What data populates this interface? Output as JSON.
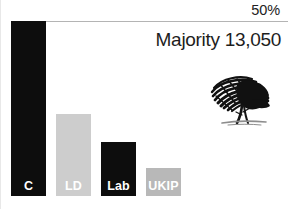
{
  "chart_data": {
    "type": "bar",
    "title": "",
    "xlabel": "",
    "ylabel": "",
    "categories": [
      "C",
      "LD",
      "Lab",
      "UKIP"
    ],
    "values": [
      50,
      23.5,
      15.5,
      8
    ],
    "ylim": [
      0,
      50
    ],
    "grid": false,
    "legend": "none",
    "series": [
      {
        "name": "Share of vote",
        "values": [
          50,
          23.5,
          15.5,
          8
        ]
      }
    ],
    "bars": [
      {
        "label": "C",
        "value": 50,
        "color": "#0d0d0d",
        "label_color": "#ffffff"
      },
      {
        "label": "LD",
        "value": 23.5,
        "color": "#cdcdcd",
        "label_color": "#ffffff"
      },
      {
        "label": "Lab",
        "value": 15.5,
        "color": "#0d0d0d",
        "label_color": "#ffffff"
      },
      {
        "label": "UKIP",
        "value": 8,
        "color": "#b8b8b8",
        "label_color": "#ffffff"
      }
    ],
    "annotations": [
      {
        "name": "threshold",
        "text": "50%",
        "value": 50
      },
      {
        "name": "majority",
        "text": "Majority 13,050"
      }
    ]
  },
  "annotations": {
    "percent_label": "50%",
    "majority_label": "Majority 13,050"
  },
  "bars": [
    {
      "label": "C"
    },
    {
      "label": "LD"
    },
    {
      "label": "Lab"
    },
    {
      "label": "UKIP"
    }
  ],
  "colors": {
    "bar_dark": "#0d0d0d",
    "bar_light_gray": "#cdcdcd",
    "bar_mid_gray": "#b8b8b8",
    "threshold_line": "#b4b4b4",
    "text": "#1d1d1d",
    "background": "#ffffff"
  },
  "logo": {
    "name": "conservative-tree-logo"
  }
}
